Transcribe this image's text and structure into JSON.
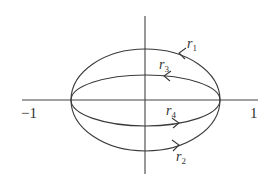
{
  "diagram": {
    "type": "paths-on-ellipse",
    "colors": {
      "line": "#3a3a3a",
      "text": "#333333",
      "background": "#ffffff"
    },
    "axes": {
      "x_tick_labels": {
        "left": "−1",
        "right": "1"
      }
    },
    "paths": [
      {
        "id": "r1",
        "name": "r",
        "sub": "1",
        "position": "upper outer arc",
        "direction": "right-to-left"
      },
      {
        "id": "r3",
        "name": "r",
        "sub": "3",
        "position": "upper inner arc",
        "direction": "right-to-left"
      },
      {
        "id": "r4",
        "name": "r",
        "sub": "4",
        "position": "lower inner arc",
        "direction": "left-to-right"
      },
      {
        "id": "r2",
        "name": "r",
        "sub": "2",
        "position": "lower outer arc",
        "direction": "left-to-right"
      }
    ]
  }
}
